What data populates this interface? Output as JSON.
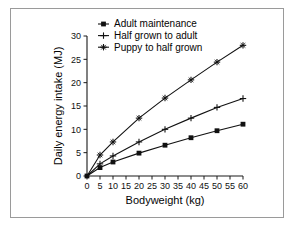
{
  "figure": {
    "background": "#ffffff",
    "frame_color": "#9a9a9a",
    "ink_color": "#111111"
  },
  "chart_data": {
    "type": "line",
    "title": "",
    "xlabel": "Bodyweight (kg)",
    "ylabel": "Daily energy intake (MJ)",
    "xlim": [
      0,
      60
    ],
    "ylim": [
      0,
      30
    ],
    "xticks": [
      0,
      5,
      10,
      15,
      20,
      25,
      30,
      35,
      40,
      45,
      50,
      55,
      60
    ],
    "xticklabels": [
      "0",
      "5",
      "10",
      "15",
      "20",
      "25",
      "30",
      "35",
      "40",
      "45",
      "50",
      "55",
      "60"
    ],
    "yticks": [
      0,
      5,
      10,
      15,
      20,
      25,
      30
    ],
    "yticklabels": [
      "0",
      "5",
      "10",
      "15",
      "20",
      "25",
      "30"
    ],
    "grid": false,
    "legend_position": "top-center",
    "x": [
      0,
      5,
      10,
      20,
      30,
      40,
      50,
      60
    ],
    "series": [
      {
        "name": "Adult maintenance",
        "marker": "filled-square",
        "values": [
          0.0,
          1.8,
          3.0,
          4.9,
          6.6,
          8.2,
          9.7,
          11.1
        ]
      },
      {
        "name": "Half grown to adult",
        "marker": "plus",
        "values": [
          0.0,
          2.6,
          4.3,
          7.3,
          10.0,
          12.4,
          14.7,
          16.6
        ]
      },
      {
        "name": "Puppy to half grown",
        "marker": "star-plus",
        "values": [
          0.0,
          4.5,
          7.3,
          12.4,
          16.7,
          20.6,
          24.4,
          28.0
        ]
      }
    ]
  },
  "legend": {
    "items": [
      {
        "label": "Adult maintenance",
        "marker": "filled-square"
      },
      {
        "label": "Half grown to adult",
        "marker": "plus"
      },
      {
        "label": "Puppy to half grown",
        "marker": "star-plus"
      }
    ]
  },
  "axes": {
    "x_title": "Bodyweight (kg)",
    "y_title": "Daily energy intake (MJ)"
  }
}
